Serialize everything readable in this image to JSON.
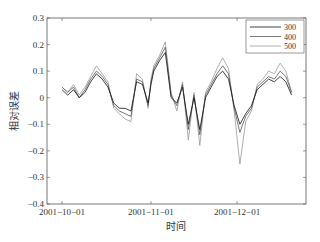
{
  "chart_data": {
    "type": "line",
    "title": "",
    "xlabel": "时间",
    "ylabel": "相对误差",
    "ylim": [
      -0.4,
      0.3
    ],
    "yticks": [
      0.3,
      0.2,
      0.1,
      0,
      -0.1,
      -0.2,
      -0.3,
      -0.4
    ],
    "ytick_labels": [
      "0.3",
      "0.2",
      "0.1",
      "0",
      "−0.1",
      "−0.2",
      "−0.3",
      "−0.4"
    ],
    "xtick_labels": [
      "2001−10−01",
      "2001−11−01",
      "2001−12−01"
    ],
    "xtick_day_offsets": [
      0,
      31,
      61
    ],
    "xlim_days": [
      -5,
      85
    ],
    "grid": false,
    "legend_position": "upper right",
    "x_days": [
      0,
      2,
      4,
      6,
      8,
      10,
      12,
      14,
      16,
      18,
      20,
      22,
      24,
      26,
      28,
      30,
      31,
      32,
      34,
      36,
      38,
      40,
      42,
      44,
      46,
      48,
      50,
      52,
      54,
      56,
      58,
      60,
      62,
      64,
      66,
      68,
      70,
      72,
      74,
      76,
      78,
      80
    ],
    "series": [
      {
        "name": "300",
        "color": "#111111",
        "values": [
          0.03,
          0.01,
          0.03,
          0.0,
          0.02,
          0.06,
          0.09,
          0.07,
          0.04,
          -0.02,
          -0.04,
          -0.04,
          -0.05,
          0.06,
          0.05,
          -0.02,
          0.05,
          0.1,
          0.14,
          0.17,
          0.0,
          -0.02,
          0.04,
          -0.1,
          0.0,
          -0.12,
          0.0,
          0.04,
          0.08,
          0.1,
          0.07,
          -0.03,
          -0.1,
          -0.06,
          -0.03,
          0.03,
          0.05,
          0.07,
          0.06,
          0.08,
          0.06,
          0.01
        ]
      },
      {
        "name": "400",
        "color": "#555555",
        "values": [
          0.04,
          0.02,
          0.04,
          0.0,
          0.03,
          0.07,
          0.1,
          0.08,
          0.05,
          -0.03,
          -0.05,
          -0.06,
          -0.07,
          0.07,
          0.06,
          -0.03,
          0.06,
          0.11,
          0.15,
          0.19,
          0.01,
          -0.03,
          0.05,
          -0.12,
          0.01,
          -0.14,
          0.01,
          0.05,
          0.09,
          0.12,
          0.09,
          -0.04,
          -0.13,
          -0.07,
          -0.04,
          0.04,
          0.06,
          0.08,
          0.07,
          0.1,
          0.08,
          0.02
        ]
      },
      {
        "name": "500",
        "color": "#999999",
        "values": [
          0.04,
          0.02,
          0.05,
          0.01,
          0.04,
          0.08,
          0.12,
          0.09,
          0.06,
          -0.04,
          -0.06,
          -0.08,
          -0.09,
          0.09,
          0.07,
          -0.04,
          0.07,
          0.12,
          0.16,
          0.21,
          0.02,
          -0.05,
          0.06,
          -0.16,
          0.02,
          -0.18,
          0.02,
          0.06,
          0.11,
          0.15,
          0.11,
          -0.05,
          -0.25,
          -0.09,
          -0.05,
          0.05,
          0.07,
          0.1,
          0.09,
          0.13,
          0.1,
          0.02
        ]
      }
    ]
  }
}
